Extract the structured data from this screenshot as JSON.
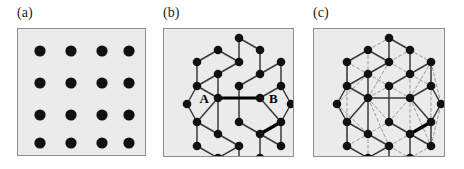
{
  "figure": {
    "caption_labels": [
      "(a)",
      "(b)",
      "(c)"
    ],
    "background_color": "#ffffff",
    "panel_fill": "#ebebeb",
    "panel_border_color": "#8c8c8c",
    "site_color": "#111111",
    "bond_color": "#3a3a3a",
    "highlight_bond_color": "#000000",
    "nnn_bond_color": "#9a9a9a"
  },
  "panels": [
    {
      "id": "panel-a",
      "label": "(a)",
      "label_x": 17,
      "label_y": 6,
      "box_x": 17,
      "box_y": 28,
      "box_w": 129,
      "box_h": 128,
      "lattice_type": "square",
      "site_radius": 5.6,
      "sites": [
        {
          "x": 22,
          "y": 22
        },
        {
          "x": 53,
          "y": 22
        },
        {
          "x": 84,
          "y": 22
        },
        {
          "x": 111,
          "y": 22
        },
        {
          "x": 22,
          "y": 54
        },
        {
          "x": 53,
          "y": 54
        },
        {
          "x": 84,
          "y": 54
        },
        {
          "x": 111,
          "y": 54
        },
        {
          "x": 22,
          "y": 86
        },
        {
          "x": 53,
          "y": 86
        },
        {
          "x": 84,
          "y": 86
        },
        {
          "x": 111,
          "y": 86
        },
        {
          "x": 22,
          "y": 114
        },
        {
          "x": 53,
          "y": 114
        },
        {
          "x": 84,
          "y": 114
        },
        {
          "x": 111,
          "y": 114
        }
      ],
      "bonds": [],
      "nnn_bonds": [],
      "site_labels": []
    },
    {
      "id": "panel-b",
      "label": "(b)",
      "label_x": 163,
      "label_y": 6,
      "box_x": 163,
      "box_y": 28,
      "box_w": 131,
      "box_h": 129,
      "lattice_type": "honeycomb",
      "site_radius": 4.3,
      "sites": [
        {
          "x": 23,
          "y": 75
        },
        {
          "x": 33,
          "y": 57
        },
        {
          "x": 33,
          "y": 93
        },
        {
          "x": 54,
          "y": 45
        },
        {
          "x": 54,
          "y": 105
        },
        {
          "x": 54,
          "y": 21
        },
        {
          "x": 54,
          "y": 129
        },
        {
          "x": 33,
          "y": 33
        },
        {
          "x": 33,
          "y": 117
        },
        {
          "x": 75,
          "y": 33
        },
        {
          "x": 75,
          "y": 117
        },
        {
          "x": 75,
          "y": 57
        },
        {
          "x": 75,
          "y": 93
        },
        {
          "x": 54,
          "y": 69
        },
        {
          "x": 96,
          "y": 21
        },
        {
          "x": 96,
          "y": 129
        },
        {
          "x": 96,
          "y": 45
        },
        {
          "x": 96,
          "y": 105
        },
        {
          "x": 75,
          "y": 9
        },
        {
          "x": 75,
          "y": 141
        },
        {
          "x": 96,
          "y": 69
        },
        {
          "x": 117,
          "y": 57
        },
        {
          "x": 117,
          "y": 93
        },
        {
          "x": 117,
          "y": 33
        },
        {
          "x": 117,
          "y": 117
        },
        {
          "x": 127,
          "y": 75
        }
      ],
      "bonds": [
        {
          "x1": 23,
          "y1": 75,
          "x2": 33,
          "y2": 57
        },
        {
          "x1": 23,
          "y1": 75,
          "x2": 33,
          "y2": 93
        },
        {
          "x1": 33,
          "y1": 57,
          "x2": 54,
          "y2": 45
        },
        {
          "x1": 33,
          "y1": 93,
          "x2": 54,
          "y2": 105
        },
        {
          "x1": 33,
          "y1": 57,
          "x2": 33,
          "y2": 33
        },
        {
          "x1": 33,
          "y1": 93,
          "x2": 33,
          "y2": 117
        },
        {
          "x1": 33,
          "y1": 33,
          "x2": 54,
          "y2": 21
        },
        {
          "x1": 33,
          "y1": 117,
          "x2": 54,
          "y2": 129
        },
        {
          "x1": 54,
          "y1": 21,
          "x2": 75,
          "y2": 33
        },
        {
          "x1": 54,
          "y1": 129,
          "x2": 75,
          "y2": 117
        },
        {
          "x1": 54,
          "y1": 45,
          "x2": 75,
          "y2": 33
        },
        {
          "x1": 54,
          "y1": 105,
          "x2": 75,
          "y2": 117
        },
        {
          "x1": 54,
          "y1": 45,
          "x2": 54,
          "y2": 69
        },
        {
          "x1": 54,
          "y1": 105,
          "x2": 54,
          "y2": 69
        },
        {
          "x1": 75,
          "y1": 33,
          "x2": 75,
          "y2": 9
        },
        {
          "x1": 75,
          "y1": 117,
          "x2": 75,
          "y2": 141
        },
        {
          "x1": 75,
          "y1": 9,
          "x2": 96,
          "y2": 21
        },
        {
          "x1": 75,
          "y1": 141,
          "x2": 96,
          "y2": 129
        },
        {
          "x1": 96,
          "y1": 21,
          "x2": 96,
          "y2": 45
        },
        {
          "x1": 96,
          "y1": 129,
          "x2": 96,
          "y2": 105
        },
        {
          "x1": 96,
          "y1": 45,
          "x2": 75,
          "y2": 57
        },
        {
          "x1": 96,
          "y1": 105,
          "x2": 75,
          "y2": 93
        },
        {
          "x1": 75,
          "y1": 57,
          "x2": 75,
          "y2": 93
        },
        {
          "x1": 96,
          "y1": 45,
          "x2": 117,
          "y2": 33
        },
        {
          "x1": 96,
          "y1": 105,
          "x2": 117,
          "y2": 117
        },
        {
          "x1": 117,
          "y1": 33,
          "x2": 117,
          "y2": 57
        },
        {
          "x1": 117,
          "y1": 117,
          "x2": 117,
          "y2": 93
        },
        {
          "x1": 117,
          "y1": 57,
          "x2": 127,
          "y2": 75
        },
        {
          "x1": 117,
          "y1": 93,
          "x2": 127,
          "y2": 75
        },
        {
          "x1": 117,
          "y1": 57,
          "x2": 96,
          "y2": 69
        },
        {
          "x1": 117,
          "y1": 93,
          "x2": 96,
          "y2": 69
        },
        {
          "x1": 54,
          "y1": 69,
          "x2": 33,
          "y2": 57
        },
        {
          "x1": 54,
          "y1": 69,
          "x2": 33,
          "y2": 93
        }
      ],
      "highlight_bonds": [
        {
          "x1": 54,
          "y1": 69,
          "x2": 96,
          "y2": 69
        },
        {
          "x1": 117,
          "y1": 93,
          "x2": 96,
          "y2": 105
        }
      ],
      "nnn_bonds": [],
      "site_labels": [
        {
          "text": "A",
          "x": 45,
          "y": 69,
          "anchor": "end"
        },
        {
          "text": "B",
          "x": 105,
          "y": 69,
          "anchor": "start"
        }
      ]
    },
    {
      "id": "panel-c",
      "label": "(c)",
      "label_x": 313,
      "label_y": 6,
      "box_x": 313,
      "box_y": 28,
      "box_w": 132,
      "box_h": 129,
      "lattice_type": "honeycomb-nnn",
      "site_radius": 4.3,
      "sites": [
        {
          "x": 23,
          "y": 75
        },
        {
          "x": 33,
          "y": 57
        },
        {
          "x": 33,
          "y": 93
        },
        {
          "x": 54,
          "y": 45
        },
        {
          "x": 54,
          "y": 105
        },
        {
          "x": 54,
          "y": 21
        },
        {
          "x": 54,
          "y": 129
        },
        {
          "x": 33,
          "y": 33
        },
        {
          "x": 33,
          "y": 117
        },
        {
          "x": 75,
          "y": 33
        },
        {
          "x": 75,
          "y": 117
        },
        {
          "x": 75,
          "y": 57
        },
        {
          "x": 75,
          "y": 93
        },
        {
          "x": 54,
          "y": 69
        },
        {
          "x": 96,
          "y": 21
        },
        {
          "x": 96,
          "y": 129
        },
        {
          "x": 96,
          "y": 45
        },
        {
          "x": 96,
          "y": 105
        },
        {
          "x": 75,
          "y": 9
        },
        {
          "x": 75,
          "y": 141
        },
        {
          "x": 96,
          "y": 69
        },
        {
          "x": 117,
          "y": 57
        },
        {
          "x": 117,
          "y": 93
        },
        {
          "x": 117,
          "y": 33
        },
        {
          "x": 117,
          "y": 117
        },
        {
          "x": 127,
          "y": 75
        }
      ],
      "bonds": [
        {
          "x1": 23,
          "y1": 75,
          "x2": 33,
          "y2": 57
        },
        {
          "x1": 23,
          "y1": 75,
          "x2": 33,
          "y2": 93
        },
        {
          "x1": 33,
          "y1": 57,
          "x2": 54,
          "y2": 45
        },
        {
          "x1": 33,
          "y1": 93,
          "x2": 54,
          "y2": 105
        },
        {
          "x1": 33,
          "y1": 57,
          "x2": 33,
          "y2": 33
        },
        {
          "x1": 33,
          "y1": 93,
          "x2": 33,
          "y2": 117
        },
        {
          "x1": 33,
          "y1": 33,
          "x2": 54,
          "y2": 21
        },
        {
          "x1": 33,
          "y1": 117,
          "x2": 54,
          "y2": 129
        },
        {
          "x1": 54,
          "y1": 21,
          "x2": 75,
          "y2": 33
        },
        {
          "x1": 54,
          "y1": 129,
          "x2": 75,
          "y2": 117
        },
        {
          "x1": 54,
          "y1": 45,
          "x2": 75,
          "y2": 33
        },
        {
          "x1": 54,
          "y1": 105,
          "x2": 75,
          "y2": 117
        },
        {
          "x1": 54,
          "y1": 45,
          "x2": 54,
          "y2": 69
        },
        {
          "x1": 54,
          "y1": 105,
          "x2": 54,
          "y2": 69
        },
        {
          "x1": 75,
          "y1": 33,
          "x2": 75,
          "y2": 9
        },
        {
          "x1": 75,
          "y1": 117,
          "x2": 75,
          "y2": 141
        },
        {
          "x1": 75,
          "y1": 9,
          "x2": 96,
          "y2": 21
        },
        {
          "x1": 75,
          "y1": 141,
          "x2": 96,
          "y2": 129
        },
        {
          "x1": 96,
          "y1": 21,
          "x2": 96,
          "y2": 45
        },
        {
          "x1": 96,
          "y1": 129,
          "x2": 96,
          "y2": 105
        },
        {
          "x1": 96,
          "y1": 45,
          "x2": 75,
          "y2": 57
        },
        {
          "x1": 96,
          "y1": 105,
          "x2": 75,
          "y2": 93
        },
        {
          "x1": 75,
          "y1": 57,
          "x2": 75,
          "y2": 93
        },
        {
          "x1": 96,
          "y1": 45,
          "x2": 117,
          "y2": 33
        },
        {
          "x1": 96,
          "y1": 105,
          "x2": 117,
          "y2": 117
        },
        {
          "x1": 117,
          "y1": 33,
          "x2": 117,
          "y2": 57
        },
        {
          "x1": 117,
          "y1": 117,
          "x2": 117,
          "y2": 93
        },
        {
          "x1": 117,
          "y1": 57,
          "x2": 127,
          "y2": 75
        },
        {
          "x1": 117,
          "y1": 93,
          "x2": 127,
          "y2": 75
        },
        {
          "x1": 117,
          "y1": 57,
          "x2": 96,
          "y2": 69
        },
        {
          "x1": 117,
          "y1": 93,
          "x2": 96,
          "y2": 69
        },
        {
          "x1": 54,
          "y1": 69,
          "x2": 33,
          "y2": 57
        },
        {
          "x1": 54,
          "y1": 69,
          "x2": 33,
          "y2": 93
        },
        {
          "x1": 54,
          "y1": 69,
          "x2": 96,
          "y2": 69
        }
      ],
      "highlight_bonds": [
        {
          "x1": 117,
          "y1": 93,
          "x2": 96,
          "y2": 105
        }
      ],
      "nnn_bonds": [
        {
          "x1": 33,
          "y1": 57,
          "x2": 33,
          "y2": 93
        },
        {
          "x1": 23,
          "y1": 75,
          "x2": 54,
          "y2": 45
        },
        {
          "x1": 23,
          "y1": 75,
          "x2": 54,
          "y2": 105
        },
        {
          "x1": 33,
          "y1": 33,
          "x2": 54,
          "y2": 45
        },
        {
          "x1": 33,
          "y1": 117,
          "x2": 54,
          "y2": 105
        },
        {
          "x1": 33,
          "y1": 57,
          "x2": 54,
          "y2": 69
        },
        {
          "x1": 33,
          "y1": 93,
          "x2": 54,
          "y2": 69
        },
        {
          "x1": 33,
          "y1": 33,
          "x2": 54,
          "y2": 21
        },
        {
          "x1": 54,
          "y1": 21,
          "x2": 54,
          "y2": 45
        },
        {
          "x1": 54,
          "y1": 105,
          "x2": 54,
          "y2": 129
        },
        {
          "x1": 54,
          "y1": 45,
          "x2": 75,
          "y2": 57
        },
        {
          "x1": 54,
          "y1": 105,
          "x2": 75,
          "y2": 93
        },
        {
          "x1": 54,
          "y1": 69,
          "x2": 75,
          "y2": 57
        },
        {
          "x1": 54,
          "y1": 69,
          "x2": 75,
          "y2": 93
        },
        {
          "x1": 54,
          "y1": 21,
          "x2": 75,
          "y2": 9
        },
        {
          "x1": 54,
          "y1": 129,
          "x2": 75,
          "y2": 141
        },
        {
          "x1": 75,
          "y1": 9,
          "x2": 96,
          "y2": 21
        },
        {
          "x1": 75,
          "y1": 141,
          "x2": 96,
          "y2": 129
        },
        {
          "x1": 75,
          "y1": 33,
          "x2": 96,
          "y2": 21
        },
        {
          "x1": 75,
          "y1": 117,
          "x2": 96,
          "y2": 129
        },
        {
          "x1": 75,
          "y1": 33,
          "x2": 96,
          "y2": 45
        },
        {
          "x1": 75,
          "y1": 117,
          "x2": 96,
          "y2": 105
        },
        {
          "x1": 75,
          "y1": 57,
          "x2": 96,
          "y2": 45
        },
        {
          "x1": 75,
          "y1": 93,
          "x2": 96,
          "y2": 105
        },
        {
          "x1": 75,
          "y1": 57,
          "x2": 96,
          "y2": 69
        },
        {
          "x1": 75,
          "y1": 93,
          "x2": 96,
          "y2": 69
        },
        {
          "x1": 96,
          "y1": 45,
          "x2": 96,
          "y2": 69
        },
        {
          "x1": 96,
          "y1": 69,
          "x2": 96,
          "y2": 105
        },
        {
          "x1": 96,
          "y1": 21,
          "x2": 117,
          "y2": 33
        },
        {
          "x1": 96,
          "y1": 129,
          "x2": 117,
          "y2": 117
        },
        {
          "x1": 96,
          "y1": 45,
          "x2": 117,
          "y2": 57
        },
        {
          "x1": 96,
          "y1": 105,
          "x2": 117,
          "y2": 93
        },
        {
          "x1": 117,
          "y1": 33,
          "x2": 127,
          "y2": 75
        },
        {
          "x1": 117,
          "y1": 117,
          "x2": 127,
          "y2": 75
        },
        {
          "x1": 117,
          "y1": 57,
          "x2": 117,
          "y2": 93
        },
        {
          "x1": 96,
          "y1": 69,
          "x2": 117,
          "y2": 33
        },
        {
          "x1": 96,
          "y1": 69,
          "x2": 117,
          "y2": 117
        },
        {
          "x1": 54,
          "y1": 69,
          "x2": 75,
          "y2": 33
        },
        {
          "x1": 54,
          "y1": 69,
          "x2": 75,
          "y2": 117
        },
        {
          "x1": 33,
          "y1": 33,
          "x2": 33,
          "y2": 57
        },
        {
          "x1": 33,
          "y1": 93,
          "x2": 33,
          "y2": 117
        }
      ],
      "site_labels": []
    }
  ]
}
